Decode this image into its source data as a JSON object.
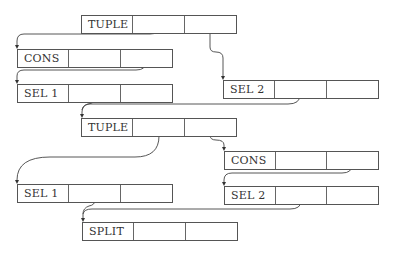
{
  "diagram": {
    "type": "linked-structure",
    "nodes": [
      {
        "id": "n1",
        "label": "TUPLE",
        "x": 81,
        "y": 15,
        "cells": 3
      },
      {
        "id": "n2",
        "label": "CONS",
        "x": 17,
        "y": 49,
        "cells": 3
      },
      {
        "id": "n3",
        "label": "SEL 1",
        "x": 17,
        "y": 84,
        "cells": 3
      },
      {
        "id": "n4",
        "label": "SEL 2",
        "x": 223,
        "y": 80,
        "cells": 3
      },
      {
        "id": "n5",
        "label": "TUPLE",
        "x": 81,
        "y": 118,
        "cells": 3
      },
      {
        "id": "n6",
        "label": "CONS",
        "x": 224,
        "y": 151,
        "cells": 3
      },
      {
        "id": "n7",
        "label": "SEL 1",
        "x": 17,
        "y": 184,
        "cells": 3
      },
      {
        "id": "n8",
        "label": "SEL 2",
        "x": 224,
        "y": 186,
        "cells": 3
      },
      {
        "id": "n9",
        "label": "SPLIT",
        "x": 82,
        "y": 222,
        "cells": 3
      }
    ],
    "edges": [
      {
        "from": "n1.cell2",
        "to": "n2"
      },
      {
        "from": "n1.cell3",
        "to": "n4"
      },
      {
        "from": "n2.cell3",
        "to": "n3"
      },
      {
        "from": "n3.cell2",
        "to": "n5"
      },
      {
        "from": "n4.cell2",
        "to": "n5"
      },
      {
        "from": "n5.cell2",
        "to": "n7"
      },
      {
        "from": "n5.cell3",
        "to": "n6"
      },
      {
        "from": "n6.cell3",
        "to": "n8"
      },
      {
        "from": "n7.cell2",
        "to": "n9"
      },
      {
        "from": "n8.cell2",
        "to": "n9"
      }
    ]
  },
  "labels": {
    "n1": "TUPLE",
    "n2": "CONS",
    "n3": "SEL 1",
    "n4": "SEL 2",
    "n5": "TUPLE",
    "n6": "CONS",
    "n7": "SEL 1",
    "n8": "SEL 2",
    "n9": "SPLIT"
  }
}
